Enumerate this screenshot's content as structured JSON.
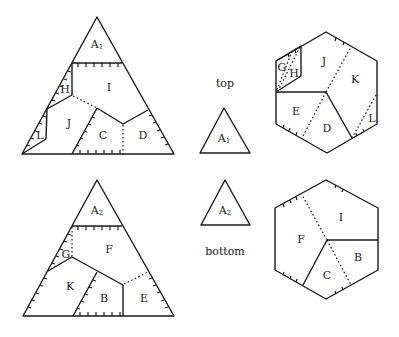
{
  "captions": {
    "top": "top",
    "bottom": "bottom"
  },
  "small_triangles": {
    "top": {
      "label": "A",
      "sub": "1"
    },
    "bottom": {
      "label": "A",
      "sub": "2"
    }
  },
  "top_triangle": {
    "cap_label": {
      "label": "A",
      "sub": "1"
    },
    "pieces": {
      "I": "I",
      "H": "H",
      "J": "J",
      "L": "L",
      "C": "C",
      "D": "D"
    }
  },
  "bottom_triangle": {
    "cap_label": {
      "label": "A",
      "sub": "2"
    },
    "pieces": {
      "F": "F",
      "G": "G",
      "K": "K",
      "B": "B",
      "E": "E"
    }
  },
  "top_hexagon": {
    "pieces": {
      "G": "G",
      "H": "H",
      "J": "J",
      "K": "K",
      "E": "E",
      "D": "D",
      "L": "L"
    }
  },
  "bottom_hexagon": {
    "pieces": {
      "I": "I",
      "F": "F",
      "B": "B",
      "C": "C"
    }
  },
  "colors": {
    "line": "#1a1a1a",
    "background": "#ffffff"
  }
}
